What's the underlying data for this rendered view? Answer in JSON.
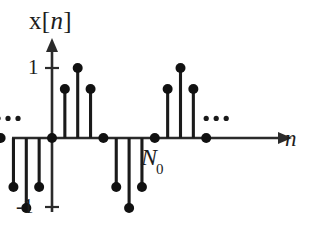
{
  "figure": {
    "title": "x[n]",
    "title_base": "x[",
    "title_italic": "n",
    "title_close": "]",
    "background_color": "#ffffff",
    "ink_color": "#1a1a1a"
  },
  "labels": {
    "y_axis_title": "x[n]",
    "x_axis_title": "n",
    "y_tick_positive": "1",
    "y_tick_negative": "-1",
    "period_marker": "N0",
    "period_marker_base": "N",
    "period_marker_sub": "0",
    "ellipsis_left": "•••",
    "ellipsis_right": "•••"
  },
  "chart_data": {
    "type": "scatter",
    "title": "x[n]",
    "xlabel": "n",
    "ylabel": "x[n]",
    "subtitle": "",
    "plot_style": "stem",
    "grid": false,
    "legend": false,
    "legend_position": "none",
    "ylim": [
      -1.25,
      1.25
    ],
    "xlim": [
      -5,
      13
    ],
    "ytick_values": [
      1,
      -1
    ],
    "ytick_labels": [
      "1",
      "-1"
    ],
    "xtick_values": [],
    "xtick_labels": [],
    "period": 8,
    "period_label": "N0",
    "period_label_x": 4,
    "annotations": [
      {
        "text": "•••",
        "x": -4.2,
        "y": 0.28,
        "name": "ellipsis-left"
      },
      {
        "text": "•••",
        "x": 12.0,
        "y": 0.28,
        "name": "ellipsis-right"
      },
      {
        "text": "N0",
        "x": 4.25,
        "y": -0.25,
        "name": "period-marker"
      }
    ],
    "series": [
      {
        "name": "x[n]",
        "x": [
          -4,
          -3,
          -2,
          -1,
          0,
          1,
          2,
          3,
          4,
          5,
          6,
          7,
          8,
          9,
          10,
          11,
          12
        ],
        "values": [
          0,
          -0.7,
          -1,
          -0.7,
          0,
          0.7,
          1,
          0.7,
          0,
          -0.7,
          -1,
          -0.7,
          0,
          0.7,
          1,
          0.7,
          0
        ]
      }
    ],
    "x": [
      -4,
      -3,
      -2,
      -1,
      0,
      1,
      2,
      3,
      4,
      5,
      6,
      7,
      8,
      9,
      10,
      11,
      12
    ],
    "values": [
      0,
      -0.7,
      -1,
      -0.7,
      0,
      0.7,
      1,
      0.7,
      0,
      -0.7,
      -1,
      -0.7,
      0,
      0.7,
      1,
      0.7,
      0
    ]
  }
}
